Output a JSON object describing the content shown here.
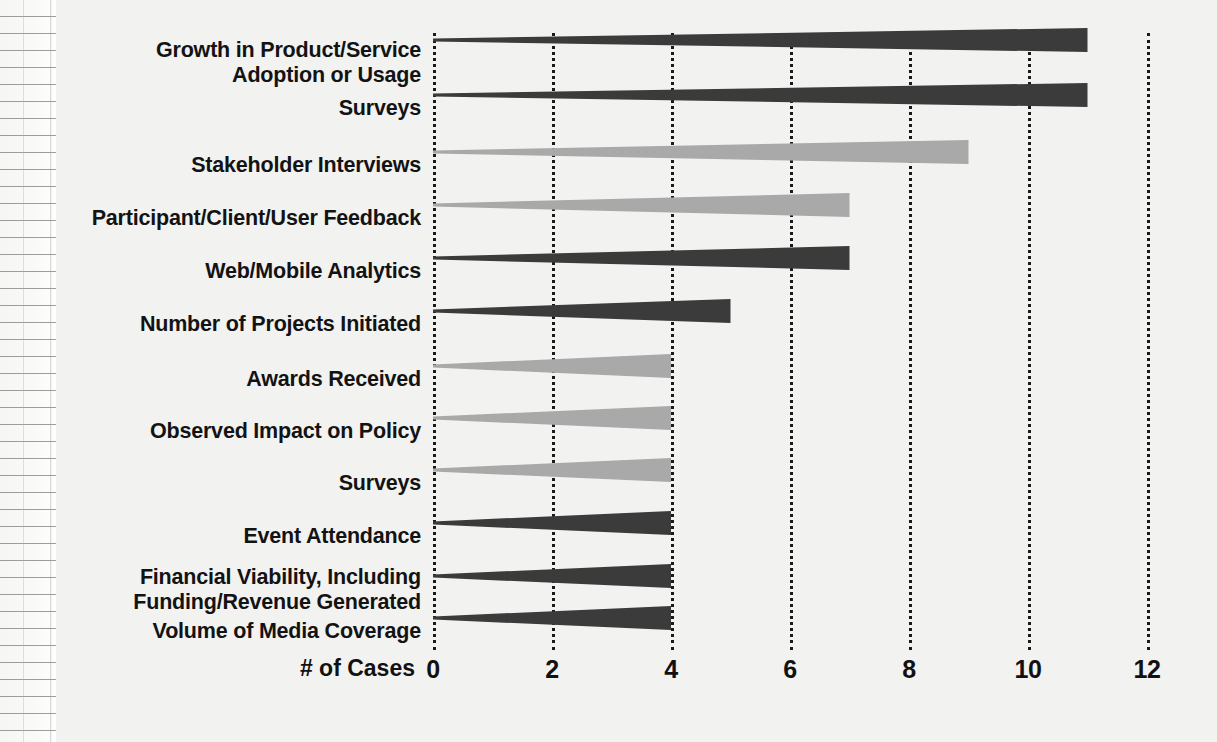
{
  "chart_data": {
    "type": "bar",
    "orientation": "horizontal",
    "title": "",
    "subtitle": "",
    "xlabel": "# of Cases",
    "ylabel": "",
    "xlim": [
      0,
      12
    ],
    "xticks": [
      "0",
      "2",
      "4",
      "6",
      "8",
      "10",
      "12"
    ],
    "xtick_values": [
      0,
      2,
      4,
      6,
      8,
      10,
      12
    ],
    "grid": "vertical dotted gridlines at each tick",
    "legend": "none",
    "bar_style": "tapered wedge, thin at axis widening toward the tip",
    "categories": [
      "Growth in Product/Service Adoption or Usage",
      "Surveys",
      "Stakeholder Interviews",
      "Participant/Client/User Feedback",
      "Web/Mobile Analytics",
      "Number of Projects Initiated",
      "Awards Received",
      "Observed Impact on Policy",
      "Surveys",
      "Event Attendance",
      "Financial Viability, Including Funding/Revenue Generated",
      "Volume of Media Coverage"
    ],
    "values": [
      11,
      11,
      9,
      7,
      7,
      5,
      4,
      4,
      4,
      4,
      4,
      4
    ],
    "colors": {
      "dark": "#3b3b3b",
      "light": "#a9a9a9"
    },
    "bars": [
      {
        "label": "Growth in Product/Service\nAdoption or Usage",
        "value": 11,
        "color": "dark",
        "top": 40,
        "label_top": 38
      },
      {
        "label": "Surveys",
        "value": 11,
        "color": "dark",
        "top": 95,
        "label_top": 96
      },
      {
        "label": "Stakeholder Interviews",
        "value": 9,
        "color": "light",
        "top": 152,
        "label_top": 153
      },
      {
        "label": "Participant/Client/User Feedback",
        "value": 7,
        "color": "light",
        "top": 205,
        "label_top": 206
      },
      {
        "label": "Web/Mobile Analytics",
        "value": 7,
        "color": "dark",
        "top": 258,
        "label_top": 259
      },
      {
        "label": "Number of Projects Initiated",
        "value": 5,
        "color": "dark",
        "top": 311,
        "label_top": 312
      },
      {
        "label": "Awards Received",
        "value": 4,
        "color": "light",
        "top": 366,
        "label_top": 367
      },
      {
        "label": "Observed Impact on Policy",
        "value": 4,
        "color": "light",
        "top": 418,
        "label_top": 419
      },
      {
        "label": "Surveys",
        "value": 4,
        "color": "light",
        "top": 470,
        "label_top": 471
      },
      {
        "label": "Event Attendance",
        "value": 4,
        "color": "dark",
        "top": 523,
        "label_top": 524
      },
      {
        "label": "Financial Viability, Including\nFunding/Revenue Generated",
        "value": 4,
        "color": "dark",
        "top": 576,
        "label_top": 565
      },
      {
        "label": "Volume of Media Coverage",
        "value": 4,
        "color": "dark",
        "top": 618,
        "label_top": 619
      }
    ]
  },
  "axis": {
    "title": "# of Cases",
    "ticks": [
      {
        "text": "0",
        "value": 0
      },
      {
        "text": "2",
        "value": 2
      },
      {
        "text": "4",
        "value": 4
      },
      {
        "text": "6",
        "value": 6
      },
      {
        "text": "8",
        "value": 8
      },
      {
        "text": "10",
        "value": 10
      },
      {
        "text": "12",
        "value": 12
      }
    ]
  }
}
